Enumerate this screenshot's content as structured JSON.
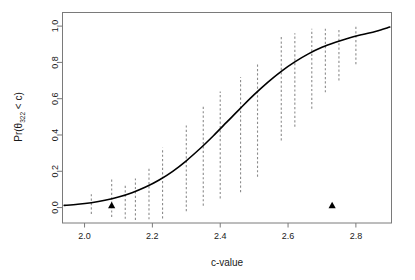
{
  "chart_data": {
    "type": "line",
    "title": "",
    "subtitle": "",
    "xlabel": "c-value",
    "ylabel": "Pr(θ322 < c)",
    "ylabel_parts": {
      "prefix": "Pr(θ",
      "subscript": "322",
      "suffix": " < c)"
    },
    "xlim": [
      1.935,
      2.905
    ],
    "ylim": [
      -0.085,
      1.075
    ],
    "xticks": [
      2.0,
      2.2,
      2.4,
      2.6,
      2.8
    ],
    "xtick_labels": [
      "2.0",
      "2.2",
      "2.4",
      "2.6",
      "2.8"
    ],
    "yticks": [
      0.0,
      0.2,
      0.4,
      0.6,
      0.8,
      1.0
    ],
    "ytick_labels": [
      "0.0",
      "0.2",
      "0.4",
      "0.6",
      "0.8",
      "1.0"
    ],
    "grid": false,
    "legend": null,
    "legend_position": "none",
    "frame": true,
    "series": [
      {
        "name": "posterior-probability-curve",
        "type": "line",
        "style": "solid",
        "color": "#000000",
        "width": 1.6,
        "x": [
          1.94,
          1.98,
          2.02,
          2.06,
          2.1,
          2.14,
          2.18,
          2.22,
          2.26,
          2.3,
          2.34,
          2.38,
          2.42,
          2.46,
          2.5,
          2.54,
          2.58,
          2.62,
          2.66,
          2.7,
          2.74,
          2.78,
          2.82,
          2.86,
          2.9
        ],
        "y": [
          0.012,
          0.018,
          0.027,
          0.04,
          0.058,
          0.082,
          0.113,
          0.152,
          0.2,
          0.258,
          0.324,
          0.396,
          0.472,
          0.548,
          0.622,
          0.69,
          0.751,
          0.803,
          0.847,
          0.883,
          0.911,
          0.935,
          0.954,
          0.972,
          0.995
        ]
      },
      {
        "name": "interval-bars",
        "type": "errorbar-vertical",
        "style": "dashed",
        "color": "#8c8c8c",
        "width": 1.1,
        "bars": [
          {
            "x": 2.02,
            "low": -0.035,
            "high": 0.08
          },
          {
            "x": 2.08,
            "low": -0.052,
            "high": 0.16
          },
          {
            "x": 2.12,
            "low": -0.062,
            "high": 0.12
          },
          {
            "x": 2.15,
            "low": -0.068,
            "high": 0.16
          },
          {
            "x": 2.19,
            "low": -0.065,
            "high": 0.215
          },
          {
            "x": 2.23,
            "low": -0.06,
            "high": 0.33
          },
          {
            "x": 2.3,
            "low": -0.02,
            "high": 0.455
          },
          {
            "x": 2.35,
            "low": 0.01,
            "high": 0.56
          },
          {
            "x": 2.4,
            "low": 0.05,
            "high": 0.64
          },
          {
            "x": 2.46,
            "low": 0.085,
            "high": 0.72
          },
          {
            "x": 2.51,
            "low": 0.17,
            "high": 0.8
          },
          {
            "x": 2.58,
            "low": 0.37,
            "high": 0.94
          },
          {
            "x": 2.62,
            "low": 0.445,
            "high": 0.96
          },
          {
            "x": 2.67,
            "low": 0.545,
            "high": 0.985
          },
          {
            "x": 2.71,
            "low": 0.635,
            "high": 0.985
          },
          {
            "x": 2.75,
            "low": 0.7,
            "high": 0.985
          },
          {
            "x": 2.8,
            "low": 0.79,
            "high": 1.0
          }
        ]
      },
      {
        "name": "observed-markers",
        "type": "scatter",
        "marker": "triangle-up-filled",
        "color": "#000000",
        "points": [
          {
            "x": 2.08,
            "y": 0.01
          },
          {
            "x": 2.73,
            "y": 0.01
          }
        ]
      }
    ]
  },
  "figure": {
    "background": "#ffffff",
    "axis_color": "#7a7a7a",
    "curve_color": "#000000",
    "interval_color": "#8c8c8c",
    "marker_color": "#000000",
    "text_color": "#1a1a1a"
  }
}
